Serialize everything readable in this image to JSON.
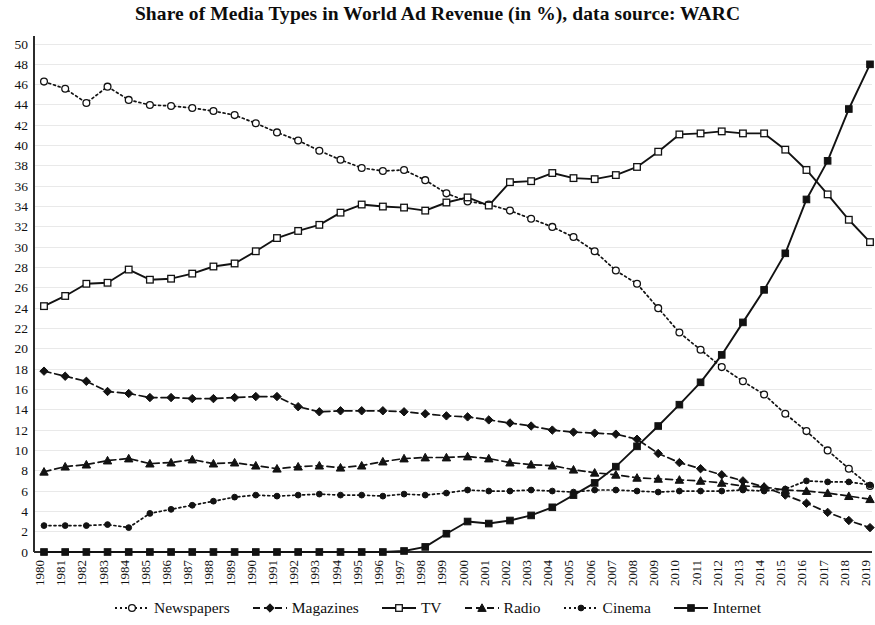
{
  "chart_data": {
    "type": "line",
    "title": "Share of Media Types in World Ad Revenue (in %), data source: WARC",
    "xlabel": "",
    "ylabel": "",
    "ylim": [
      0,
      50
    ],
    "ytick_step": 2,
    "grid": true,
    "legend_position": "bottom",
    "x": [
      1980,
      1981,
      1982,
      1983,
      1984,
      1985,
      1986,
      1987,
      1988,
      1989,
      1990,
      1991,
      1992,
      1993,
      1994,
      1995,
      1996,
      1997,
      1998,
      1999,
      2000,
      2001,
      2002,
      2003,
      2004,
      2005,
      2006,
      2007,
      2008,
      2009,
      2010,
      2011,
      2012,
      2013,
      2014,
      2015,
      2016,
      2017,
      2018,
      2019
    ],
    "yticks": [
      0,
      2,
      4,
      6,
      8,
      10,
      12,
      14,
      16,
      18,
      20,
      22,
      24,
      26,
      28,
      30,
      32,
      34,
      36,
      38,
      40,
      42,
      44,
      46,
      48,
      50
    ],
    "series": [
      {
        "name": "Newspapers",
        "marker": "open-circle",
        "dash": "dotted",
        "color": "#121212",
        "values": [
          46.3,
          45.6,
          44.2,
          45.8,
          44.5,
          44.0,
          43.9,
          43.7,
          43.4,
          43.0,
          42.2,
          41.3,
          40.5,
          39.5,
          38.6,
          37.8,
          37.5,
          37.6,
          36.6,
          35.3,
          34.5,
          34.2,
          33.6,
          32.8,
          32.0,
          31.0,
          29.6,
          27.7,
          26.4,
          24.0,
          21.6,
          19.9,
          18.2,
          16.8,
          15.5,
          13.6,
          11.9,
          10.0,
          8.2,
          6.5
        ]
      },
      {
        "name": "Magazines",
        "marker": "solid-diamond",
        "dash": "dashed",
        "color": "#121212",
        "values": [
          17.8,
          17.3,
          16.8,
          15.8,
          15.6,
          15.2,
          15.2,
          15.1,
          15.1,
          15.2,
          15.3,
          15.3,
          14.3,
          13.8,
          13.9,
          13.9,
          13.9,
          13.8,
          13.6,
          13.4,
          13.3,
          13.0,
          12.7,
          12.4,
          12.0,
          11.8,
          11.7,
          11.6,
          11.1,
          9.7,
          8.8,
          8.2,
          7.6,
          7.0,
          6.4,
          5.6,
          4.8,
          3.9,
          3.1,
          2.4
        ]
      },
      {
        "name": "TV",
        "marker": "open-square",
        "dash": "solid",
        "color": "#121212",
        "values": [
          24.2,
          25.2,
          26.4,
          26.5,
          27.8,
          26.8,
          26.9,
          27.4,
          28.1,
          28.4,
          29.6,
          30.9,
          31.6,
          32.2,
          33.4,
          34.2,
          34.0,
          33.9,
          33.6,
          34.4,
          34.9,
          34.1,
          36.4,
          36.5,
          37.3,
          36.8,
          36.7,
          37.1,
          37.9,
          39.4,
          41.1,
          41.2,
          41.4,
          41.2,
          41.2,
          39.6,
          37.6,
          35.2,
          32.7,
          30.5
        ]
      },
      {
        "name": "Radio",
        "marker": "solid-triangle",
        "dash": "dashed",
        "color": "#121212",
        "values": [
          7.9,
          8.4,
          8.6,
          9.0,
          9.2,
          8.7,
          8.8,
          9.1,
          8.7,
          8.8,
          8.5,
          8.2,
          8.4,
          8.5,
          8.3,
          8.5,
          8.9,
          9.2,
          9.3,
          9.3,
          9.4,
          9.2,
          8.8,
          8.6,
          8.5,
          8.1,
          7.8,
          7.6,
          7.3,
          7.2,
          7.1,
          7.0,
          6.8,
          6.5,
          6.4,
          6.1,
          6.0,
          5.8,
          5.5,
          5.2
        ]
      },
      {
        "name": "Cinema",
        "marker": "solid-circle",
        "dash": "dotted",
        "color": "#121212",
        "values": [
          2.6,
          2.6,
          2.6,
          2.7,
          2.4,
          3.8,
          4.2,
          4.6,
          5.0,
          5.4,
          5.6,
          5.5,
          5.6,
          5.7,
          5.6,
          5.6,
          5.5,
          5.7,
          5.6,
          5.8,
          6.1,
          6.0,
          6.0,
          6.1,
          6.0,
          5.9,
          6.1,
          6.1,
          6.0,
          5.9,
          6.0,
          6.0,
          6.0,
          6.1,
          6.0,
          6.2,
          7.0,
          6.9,
          6.9,
          6.6
        ]
      },
      {
        "name": "Internet",
        "marker": "solid-square",
        "dash": "solid",
        "color": "#121212",
        "values": [
          0,
          0,
          0,
          0,
          0,
          0,
          0,
          0,
          0,
          0,
          0,
          0,
          0,
          0,
          0,
          0,
          0,
          0.1,
          0.5,
          1.8,
          3.0,
          2.8,
          3.1,
          3.6,
          4.4,
          5.6,
          6.8,
          8.4,
          10.4,
          12.4,
          14.5,
          16.7,
          19.4,
          22.6,
          25.8,
          29.4,
          34.7,
          38.5,
          43.6,
          48.0
        ]
      }
    ]
  },
  "legend": {
    "items": [
      {
        "label": "Newspapers"
      },
      {
        "label": "Magazines"
      },
      {
        "label": "TV"
      },
      {
        "label": "Radio"
      },
      {
        "label": "Cinema"
      },
      {
        "label": "Internet"
      }
    ]
  }
}
